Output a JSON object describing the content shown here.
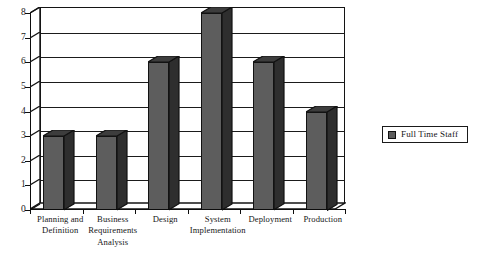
{
  "chart_data": {
    "type": "bar",
    "title": "",
    "subtitle": "",
    "xlabel": "",
    "ylabel": "",
    "categories": [
      "Planning and Definition",
      "Business Requirements Analysis",
      "Design",
      "System Implementation",
      "Deployment",
      "Production"
    ],
    "series": [
      {
        "name": "Full Time Staff",
        "values": [
          3,
          3,
          6,
          8,
          6,
          4
        ],
        "color": "#5d5d5d"
      }
    ],
    "values": [
      3,
      3,
      6,
      8,
      6,
      4
    ],
    "ylim": [
      0,
      8
    ],
    "ytick_labels": [
      "0",
      "1",
      "2",
      "3",
      "4",
      "5",
      "6",
      "7",
      "8"
    ],
    "ytick_values": [
      0,
      1,
      2,
      3,
      4,
      5,
      6,
      7,
      8
    ],
    "grid": true,
    "grid_axis": "y",
    "legend_position": "right",
    "style": "3d-column",
    "bar_color": "#5d5d5d",
    "bar_edge_color": "#121212",
    "axis_color": "#0d0d0d",
    "background": "#ffffff"
  },
  "legend": {
    "entries": [
      {
        "label": "Full Time Staff",
        "swatch_icon": "square-swatch-icon",
        "color": "#5d5d5d"
      }
    ]
  },
  "axes": {
    "y_ticks": [
      "0",
      "1",
      "2",
      "3",
      "4",
      "5",
      "6",
      "7",
      "8"
    ],
    "x_categories": [
      "Planning and Definition",
      "Business Requirements Analysis",
      "Design",
      "System Implementation",
      "Deployment",
      "Production"
    ]
  }
}
